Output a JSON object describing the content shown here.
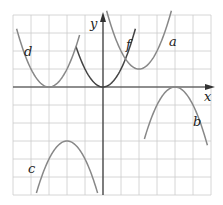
{
  "chart_data": {
    "type": "line",
    "title": "",
    "xlabel": "x",
    "ylabel": "y",
    "grid": true,
    "xlim": [
      -5,
      6
    ],
    "ylim": [
      -6,
      4
    ],
    "unit_px": 18,
    "origin_px": [
      103,
      87
    ],
    "colors": {
      "grid": "#cccccc",
      "axis": "#333333",
      "f": "#444444",
      "others": "#888888"
    },
    "series": [
      {
        "name": "f",
        "equation": "y = x^2",
        "vertex": [
          0,
          0
        ],
        "x_range": [
          -1.5,
          1.8
        ],
        "opens": "up"
      },
      {
        "name": "a",
        "equation": "y = (x-2)^2 + 1",
        "vertex": [
          2,
          1
        ],
        "x_range": [
          0.2,
          3.8
        ],
        "opens": "up"
      },
      {
        "name": "d",
        "equation": "y = (x+3)^2",
        "vertex": [
          -3,
          0
        ],
        "x_range": [
          -4.8,
          -1.3
        ],
        "opens": "up"
      },
      {
        "name": "b",
        "equation": "y = -(x-4)^2",
        "vertex": [
          4,
          0
        ],
        "x_range": [
          2.3,
          5.8
        ],
        "opens": "down"
      },
      {
        "name": "c",
        "equation": "y = -(x+2)^2 - 3",
        "vertex": [
          -2,
          -3
        ],
        "x_range": [
          -3.7,
          -0.3
        ],
        "opens": "down"
      }
    ],
    "labels": {
      "x_axis": "x",
      "y_axis": "y",
      "a": "a",
      "b": "b",
      "c": "c",
      "d": "d",
      "f": "f"
    }
  }
}
